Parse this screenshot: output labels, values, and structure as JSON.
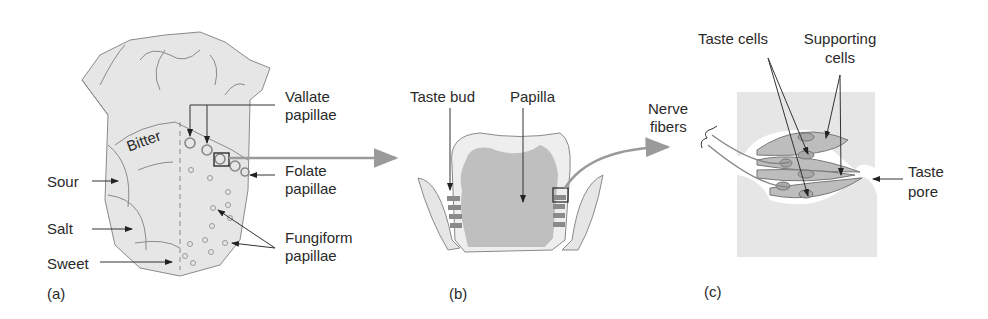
{
  "panels": {
    "a": {
      "tag": "(a)",
      "regions": {
        "bitter": "Bitter",
        "sour": "Sour",
        "salt": "Salt",
        "sweet": "Sweet"
      },
      "labels": {
        "vallate_1": "Vallate",
        "vallate_2": "papillae",
        "folate_1": "Folate",
        "folate_2": "papillae",
        "fungiform_1": "Fungiform",
        "fungiform_2": "papillae"
      }
    },
    "b": {
      "tag": "(b)",
      "labels": {
        "taste_bud": "Taste bud",
        "papilla": "Papilla"
      }
    },
    "c": {
      "tag": "(c)",
      "labels": {
        "taste_cells": "Taste cells",
        "supporting_1": "Supporting",
        "supporting_2": "cells",
        "nerve_1": "Nerve",
        "nerve_2": "fibers",
        "pore_1": "Taste",
        "pore_2": "pore"
      }
    }
  },
  "colors": {
    "fill_light": "#e4e4e4",
    "fill_mid": "#bdbdbd",
    "outline": "#7a7a7a",
    "arrow_grey": "#9a9a9a",
    "text": "#2a2a2a"
  }
}
